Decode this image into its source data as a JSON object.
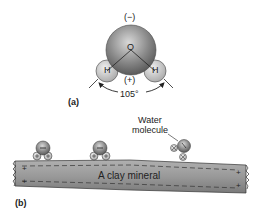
{
  "panel_a": {
    "label": "(a)",
    "oxygen_symbol": "O",
    "hydrogen_left_symbol": "H",
    "hydrogen_right_symbol": "H",
    "negative_charge": "(−)",
    "positive_charge": "(+)",
    "bond_angle": "105°"
  },
  "panel_b": {
    "label": "(b)",
    "water_molecule_label_line1": "Water",
    "water_molecule_label_line2": "molecule",
    "mineral_label": "A clay mineral",
    "surface_charge_sign": "+",
    "edge_charge_sign": "+"
  },
  "colors": {
    "oxygen_fill": "#8a8a8a",
    "hydrogen_fill": "#c8c8c8",
    "mineral_fill": "#9a9a9a",
    "outline": "#333333"
  }
}
